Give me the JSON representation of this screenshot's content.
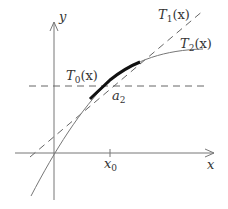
{
  "diagram": {
    "type": "taylor-approximation",
    "axes": {
      "x_label": "x",
      "y_label": "y",
      "x_tick_label": "x",
      "x_tick_sub": "0"
    },
    "curves": [
      {
        "name": "T",
        "sub": "0",
        "arg": "(x)",
        "style": "dashed",
        "description": "constant approximation (horizontal)"
      },
      {
        "name": "T",
        "sub": "1",
        "arg": "(x)",
        "style": "dashed",
        "description": "linear approximation (tangent line)"
      },
      {
        "name": "T",
        "sub": "2",
        "arg": "(x)",
        "style": "solid",
        "description": "quadratic approximation / function curve"
      }
    ],
    "highlight": {
      "label": "a",
      "sub": "2",
      "description": "thick segment near x0 where approximations agree"
    },
    "colors": {
      "axis": "#777777",
      "dashed": "#666666",
      "curve": "#777777",
      "highlight": "#111111",
      "text": "#333333"
    }
  }
}
